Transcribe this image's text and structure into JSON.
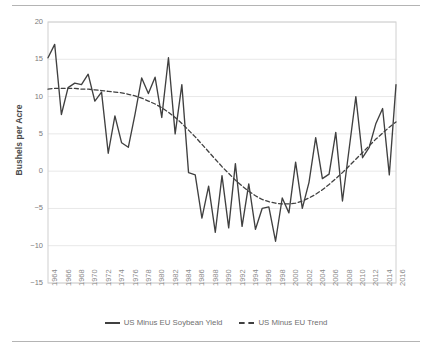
{
  "chart_data": {
    "type": "line",
    "title": "",
    "xlabel": "",
    "ylabel": "Bushels per Acre",
    "ylim": [
      -15,
      20
    ],
    "xlim": [
      1964,
      2016
    ],
    "grid": true,
    "legend_position": "bottom",
    "yticks": [
      20,
      15,
      10,
      5,
      0,
      -5,
      -10,
      -15
    ],
    "xticks": [
      1964,
      1966,
      1968,
      1970,
      1972,
      1974,
      1976,
      1978,
      1980,
      1982,
      1984,
      1986,
      1988,
      1990,
      1992,
      1994,
      1996,
      1998,
      2000,
      2002,
      2004,
      2006,
      2008,
      2010,
      2012,
      2014,
      2016
    ],
    "x": [
      1964,
      1965,
      1966,
      1967,
      1968,
      1969,
      1970,
      1971,
      1972,
      1973,
      1974,
      1975,
      1976,
      1977,
      1978,
      1979,
      1980,
      1981,
      1982,
      1983,
      1984,
      1985,
      1986,
      1987,
      1988,
      1989,
      1990,
      1991,
      1992,
      1993,
      1994,
      1995,
      1996,
      1997,
      1998,
      1999,
      2000,
      2001,
      2002,
      2003,
      2004,
      2005,
      2006,
      2007,
      2008,
      2009,
      2010,
      2011,
      2012,
      2013,
      2014,
      2015,
      2016
    ],
    "series": [
      {
        "name": "US Minus EU Soybean Yield",
        "style": "solid",
        "color": "#404040",
        "values": [
          15.2,
          17.0,
          7.6,
          11.2,
          11.8,
          11.6,
          13.0,
          9.4,
          10.6,
          2.4,
          7.4,
          3.8,
          3.2,
          7.6,
          12.5,
          10.4,
          12.6,
          7.2,
          15.2,
          5.0,
          11.6,
          -0.2,
          -0.5,
          -6.3,
          -2.0,
          -8.2,
          -0.6,
          -7.6,
          1.0,
          -7.4,
          -1.7,
          -7.8,
          -5.0,
          -4.8,
          -9.4,
          -3.6,
          -5.6,
          1.2,
          -5.0,
          -1.5,
          4.5,
          -1.0,
          -0.4,
          5.2,
          -4.0,
          3.0,
          10.0,
          1.8,
          3.2,
          6.4,
          8.4,
          -0.5,
          11.6
        ]
      },
      {
        "name": "US Minus EU Trend",
        "style": "dashed",
        "color": "#404040",
        "values": [
          11.0,
          11.1,
          11.1,
          11.1,
          11.1,
          11.0,
          11.0,
          10.9,
          10.8,
          10.7,
          10.6,
          10.5,
          10.3,
          10.1,
          9.8,
          9.4,
          9.0,
          8.5,
          7.9,
          7.2,
          6.4,
          5.5,
          4.6,
          3.6,
          2.6,
          1.6,
          0.6,
          -0.3,
          -1.2,
          -2.0,
          -2.7,
          -3.3,
          -3.8,
          -4.1,
          -4.3,
          -4.4,
          -4.4,
          -4.3,
          -4.0,
          -3.6,
          -3.1,
          -2.5,
          -1.8,
          -1.0,
          -0.2,
          0.7,
          1.6,
          2.5,
          3.4,
          4.3,
          5.1,
          5.9,
          6.6
        ]
      }
    ],
    "legend": [
      {
        "label": "US Minus EU Soybean Yield",
        "style": "solid"
      },
      {
        "label": "US Minus EU Trend",
        "style": "dashed"
      }
    ],
    "colors": {
      "series_line": "#404040",
      "gridline": "#e8e8e8",
      "axis_line": "#d0d0d0",
      "tick_text": "#8a8a8a",
      "axis_title": "#4a4a4a"
    }
  }
}
